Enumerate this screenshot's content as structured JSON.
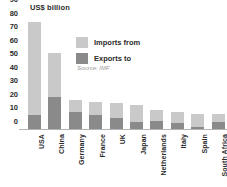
{
  "chart_data": {
    "type": "bar",
    "title": "US$ billion",
    "subtitle": "",
    "xlabel": "",
    "ylabel": "US$ billion",
    "ylim": [
      0,
      90
    ],
    "ytick_values": [
      0,
      10,
      20,
      30,
      40,
      50,
      60,
      70,
      80,
      90
    ],
    "ytick_labels": [
      "0",
      "10",
      "20",
      "30",
      "40",
      "50",
      "60",
      "70",
      "80",
      "90"
    ],
    "grid": false,
    "stacked": true,
    "legend_position": "inside-upper-left",
    "annotation": "Source: IMF",
    "categories": [
      "USA",
      "China",
      "Germany",
      "France",
      "UK",
      "Japan",
      "Netherlands",
      "Italy",
      "Spain",
      "South Africa"
    ],
    "series": [
      {
        "name": "Exports to",
        "color": "#8a8a8a",
        "values": [
          11,
          24,
          13,
          11,
          9,
          6,
          7,
          5,
          2,
          6
        ]
      },
      {
        "name": "Imports from",
        "color": "#c9c9c9",
        "values": [
          69,
          33,
          9,
          9.5,
          11,
          12.5,
          8,
          8,
          10,
          5.5
        ]
      }
    ],
    "totals": [
      80,
      57,
      22,
      20.5,
      20,
      18.5,
      15,
      13,
      12,
      11.5
    ]
  },
  "legend": {
    "items": [
      {
        "label": "Imports from",
        "color": "#c9c9c9"
      },
      {
        "label": "Exports to",
        "color": "#8a8a8a"
      }
    ]
  },
  "source": {
    "text": "Source: IMF"
  },
  "axis": {
    "unit_label": "US$ billion"
  },
  "colors": {
    "imports": "#c9c9c9",
    "exports": "#8a8a8a",
    "text": "#2b2b2b",
    "source_text": "#9a9a9a",
    "baseline": "#b4b4b4",
    "background": "#ffffff"
  }
}
